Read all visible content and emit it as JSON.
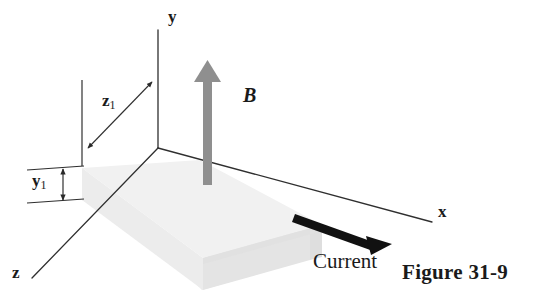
{
  "figure": {
    "caption": "Figure 31-9",
    "background_color": "#ffffff",
    "axes": [
      {
        "name": "y-axis",
        "label": "y",
        "label_x": 170,
        "label_y": 10,
        "line": {
          "x1": 158,
          "y1": 148,
          "x2": 158,
          "y2": 30
        }
      },
      {
        "name": "x-axis",
        "label": "x",
        "label_x": 440,
        "label_y": 205,
        "line": {
          "x1": 158,
          "y1": 148,
          "x2": 432,
          "y2": 222
        }
      },
      {
        "name": "z-axis",
        "label": "z",
        "label_x": 14,
        "label_y": 270,
        "line": {
          "x1": 158,
          "y1": 148,
          "x2": 32,
          "y2": 278
        }
      }
    ],
    "dimensions": [
      {
        "name": "z1",
        "label": "z",
        "subscript": "1",
        "label_x": 103,
        "label_y": 94
      },
      {
        "name": "y1",
        "label": "y",
        "subscript": "1",
        "label_x": 34,
        "label_y": 174
      }
    ],
    "vectors": [
      {
        "name": "magnetic-field-arrow",
        "label": "B",
        "label_x": 243,
        "label_y": 87,
        "color": "#8f8f8f",
        "direction": "up"
      },
      {
        "name": "current-arrow",
        "label": "Current",
        "label_x": 313,
        "label_y": 253,
        "color": "#111111",
        "direction": "right-down"
      }
    ],
    "slab": {
      "name": "conducting-slab",
      "top_face_color": "#efefef",
      "front_face_color": "#e8e8e8",
      "right_face_color": "#e3e3e3"
    },
    "caption_x": 402,
    "caption_y": 264
  }
}
